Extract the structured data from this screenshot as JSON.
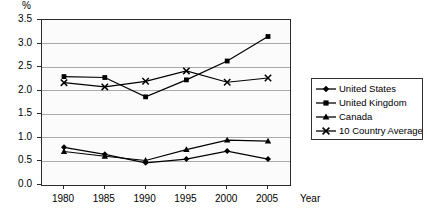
{
  "chart_data": {
    "type": "line",
    "title": "",
    "xlabel": "Year",
    "ylabel": "%",
    "unit_label": "%",
    "x": [
      1980,
      1985,
      1990,
      1995,
      2000,
      2005
    ],
    "xticklabels": [
      "1980",
      "1985",
      "1990",
      "1995",
      "2000",
      "2005"
    ],
    "yticklabels": [
      "0.0",
      "0.5",
      "1.0",
      "1.5",
      "2.0",
      "2.5",
      "3.0",
      "3.5"
    ],
    "yticks": [
      0.0,
      0.5,
      1.0,
      1.5,
      2.0,
      2.5,
      3.0,
      3.5
    ],
    "ylim": [
      0.0,
      3.5
    ],
    "grid": "horizontal",
    "legend_position": "right",
    "series": [
      {
        "name": "United States",
        "marker": "diamond",
        "color": "#000000",
        "values": [
          0.8,
          0.65,
          0.47,
          0.55,
          0.72,
          0.55
        ]
      },
      {
        "name": "United Kingdom",
        "marker": "square",
        "color": "#000000",
        "values": [
          2.3,
          2.28,
          1.87,
          2.23,
          2.63,
          3.15
        ]
      },
      {
        "name": "Canada",
        "marker": "triangle",
        "color": "#000000",
        "values": [
          0.71,
          0.61,
          0.52,
          0.75,
          0.95,
          0.93
        ]
      },
      {
        "name": "10 Country Average",
        "marker": "cross",
        "color": "#000000",
        "values": [
          2.17,
          2.08,
          2.2,
          2.42,
          2.18,
          2.27
        ]
      }
    ]
  },
  "legend": {
    "items": [
      {
        "label": "United States",
        "marker": "diamond"
      },
      {
        "label": "United Kingdom",
        "marker": "square"
      },
      {
        "label": "Canada",
        "marker": "triangle"
      },
      {
        "label": "10 Country Average",
        "marker": "cross"
      }
    ]
  },
  "colors": {
    "ink": "#000000",
    "gridline": "#a9a9a9",
    "axis": "#2b2b2b",
    "plot_background": "#fbfbfb",
    "page_background": "#ffffff"
  }
}
